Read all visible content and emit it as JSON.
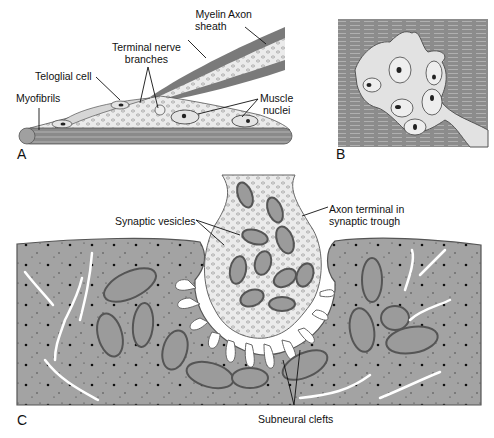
{
  "panels": {
    "A": {
      "letter": "A",
      "labels": {
        "myelin_sheath_1": "Myelin",
        "myelin_sheath_2": "sheath",
        "axon": "Axon",
        "terminal_nerve_1": "Terminal nerve",
        "terminal_nerve_2": "branches",
        "teloglial_cell": "Teloglial cell",
        "myofibrils": "Myofibrils",
        "muscle_nuclei_1": "Muscle",
        "muscle_nuclei_2": "nuclei"
      }
    },
    "B": {
      "letter": "B"
    },
    "C": {
      "letter": "C",
      "labels": {
        "synaptic_vesicles": "Synaptic vesicles",
        "axon_terminal_1": "Axon terminal in",
        "axon_terminal_2": "synaptic trough",
        "subneural_clefts": "Subneural clefts"
      }
    }
  },
  "colors": {
    "muscle_gray": "#9a9a9a",
    "dark_gray": "#6e6e6e",
    "light_fill": "#e8e8e8",
    "outline": "#444444"
  }
}
